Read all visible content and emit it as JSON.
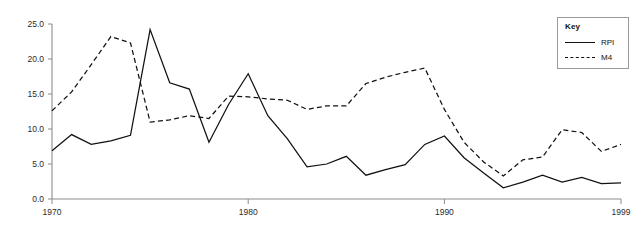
{
  "chart_data": {
    "type": "line",
    "title": "",
    "subtitle": "",
    "xlabel": "",
    "ylabel": "",
    "xlim": [
      1970,
      1999
    ],
    "ylim": [
      0.0,
      25.0
    ],
    "grid": false,
    "legend_position": "top-right",
    "legend_title": "Key",
    "x": [
      1970,
      1971,
      1972,
      1973,
      1974,
      1975,
      1976,
      1977,
      1978,
      1979,
      1980,
      1981,
      1982,
      1983,
      1984,
      1985,
      1986,
      1987,
      1988,
      1989,
      1990,
      1991,
      1992,
      1993,
      1994,
      1995,
      1996,
      1997,
      1998,
      1999
    ],
    "x_tick_labels": [
      "1970",
      "1980",
      "1990",
      "1999"
    ],
    "x_tick_values": [
      1970,
      1980,
      1990,
      1999
    ],
    "y_tick_labels": [
      "0.0",
      "5.0",
      "10.0",
      "15.0",
      "20.0",
      "25.0"
    ],
    "y_tick_values": [
      0.0,
      5.0,
      10.0,
      15.0,
      20.0,
      25.0
    ],
    "series": [
      {
        "name": "RPI",
        "style": "solid",
        "color": "#111111",
        "values": [
          6.9,
          9.2,
          7.8,
          8.3,
          9.1,
          24.2,
          16.6,
          15.7,
          8.1,
          13.5,
          17.9,
          11.9,
          8.6,
          4.6,
          5.0,
          6.1,
          3.4,
          4.2,
          4.9,
          7.8,
          9.0,
          5.9,
          3.7,
          1.6,
          2.4,
          3.4,
          2.4,
          3.1,
          2.2,
          2.3
        ]
      },
      {
        "name": "M4",
        "style": "dashed",
        "color": "#111111",
        "values": [
          12.6,
          15.3,
          19.2,
          23.2,
          22.3,
          11.0,
          11.3,
          11.9,
          11.5,
          14.7,
          14.6,
          14.3,
          14.1,
          12.8,
          13.3,
          13.3,
          16.5,
          17.4,
          18.1,
          18.7,
          12.8,
          8.1,
          5.3,
          3.3,
          5.6,
          6.0,
          9.9,
          9.5,
          6.8,
          7.8
        ]
      }
    ]
  },
  "legend": {
    "title": "Key",
    "entries": [
      {
        "label": "RPI",
        "style": "solid"
      },
      {
        "label": "M4",
        "style": "dashed"
      }
    ]
  }
}
